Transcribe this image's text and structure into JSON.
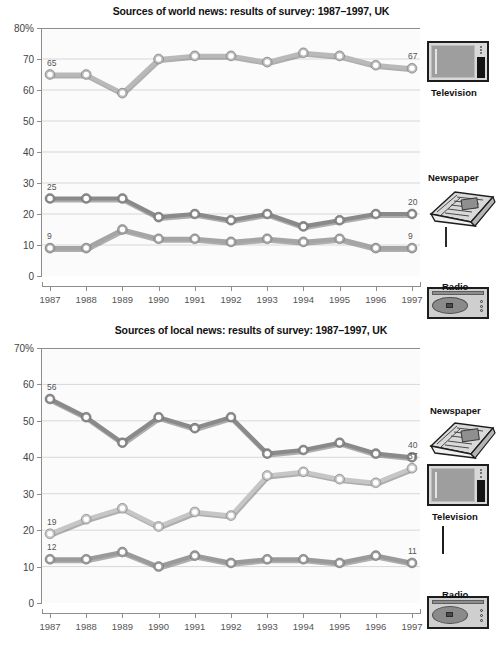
{
  "chart_data": [
    {
      "type": "line",
      "title": "Sources of world news: results of survey: 1987–1997, UK",
      "xlabel": "",
      "ylabel": "",
      "ylim": [
        0,
        80
      ],
      "yticks": [
        "0",
        "10",
        "20",
        "30",
        "40",
        "50",
        "60",
        "70",
        "80%"
      ],
      "axis_unit": "%",
      "grid": true,
      "legend_position": "right",
      "categories": [
        "1987",
        "1988",
        "1989",
        "1990",
        "1991",
        "1992",
        "1993",
        "1994",
        "1995",
        "1996",
        "1997"
      ],
      "series": [
        {
          "name": "Television",
          "color": "#b9b9b9",
          "values": [
            65,
            65,
            59,
            70,
            71,
            71,
            69,
            72,
            71,
            68,
            67
          ],
          "start_label": "65",
          "end_label": "67"
        },
        {
          "name": "Newspaper",
          "color": "#8a8a8a",
          "values": [
            25,
            25,
            25,
            19,
            20,
            18,
            20,
            16,
            18,
            20,
            20
          ],
          "start_label": "25",
          "end_label": "20"
        },
        {
          "name": "Radio",
          "color": "#a5a5a5",
          "values": [
            9,
            9,
            15,
            12,
            12,
            11,
            12,
            11,
            12,
            9,
            9
          ],
          "start_label": "9",
          "end_label": "9"
        }
      ],
      "legend_items": [
        {
          "label": "Television",
          "icon": "television-icon"
        },
        {
          "label": "Newspaper",
          "icon": "newspaper-icon"
        },
        {
          "label": "Radio",
          "icon": "radio-icon"
        }
      ]
    },
    {
      "type": "line",
      "title": "Sources of local news: results of survey: 1987–1997, UK",
      "xlabel": "",
      "ylabel": "",
      "ylim": [
        0,
        70
      ],
      "yticks": [
        "0",
        "10",
        "20",
        "30",
        "40",
        "50",
        "60",
        "70%"
      ],
      "axis_unit": "%",
      "grid": true,
      "legend_position": "right",
      "categories": [
        "1987",
        "1988",
        "1989",
        "1990",
        "1991",
        "1992",
        "1993",
        "1994",
        "1995",
        "1996",
        "1997"
      ],
      "series": [
        {
          "name": "Newspaper",
          "color": "#8a8a8a",
          "values": [
            56,
            51,
            44,
            51,
            48,
            51,
            41,
            42,
            44,
            41,
            40
          ],
          "start_label": "56",
          "end_label": "40"
        },
        {
          "name": "Television",
          "color": "#c6c6c6",
          "values": [
            19,
            23,
            26,
            21,
            25,
            24,
            35,
            36,
            34,
            33,
            37
          ],
          "start_label": "19",
          "end_label": "37"
        },
        {
          "name": "Radio",
          "color": "#9a9a9a",
          "values": [
            12,
            12,
            14,
            10,
            13,
            11,
            12,
            12,
            11,
            13,
            11
          ],
          "start_label": "12",
          "end_label": "11"
        }
      ],
      "legend_items": [
        {
          "label": "Newspaper",
          "icon": "newspaper-icon"
        },
        {
          "label": "Television",
          "icon": "television-icon"
        },
        {
          "label": "Radio",
          "icon": "radio-icon"
        }
      ]
    }
  ],
  "colors": {
    "plot_background": "#fbfbfb",
    "axis": "#8d8d8d",
    "grid": "#cfcfcf",
    "text": "#1a1a1a"
  }
}
